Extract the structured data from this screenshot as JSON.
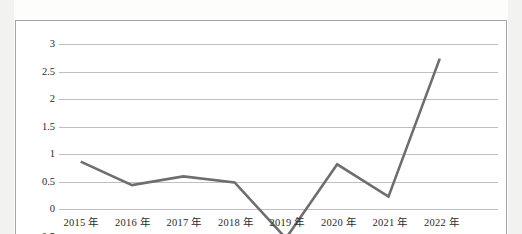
{
  "chart_data": {
    "type": "line",
    "title": "",
    "subtitle": "",
    "xlabel": "",
    "ylabel": "",
    "categories": [
      "2015 年",
      "2016 年",
      "2017 年",
      "2018 年",
      "2019 年",
      "2020 年",
      "2021 年",
      "2022 年"
    ],
    "values": [
      0.85,
      0.42,
      0.58,
      0.47,
      -0.55,
      0.8,
      0.21,
      2.73
    ],
    "series": [
      {
        "name": "",
        "values": [
          0.85,
          0.42,
          0.58,
          0.47,
          -0.55,
          0.8,
          0.21,
          2.73
        ]
      }
    ],
    "ylim": [
      -0.5,
      3
    ],
    "y_ticks": [
      "3",
      "2.5",
      "2",
      "1.5",
      "1",
      "0.5",
      "0",
      "-0.5"
    ],
    "y_tick_values": [
      3,
      2.5,
      2,
      1.5,
      1,
      0.5,
      0,
      -0.5
    ],
    "x_ticks": [
      "2015 年",
      "2016 年",
      "2017 年",
      "2018 年",
      "2019 年",
      "2020 年",
      "2021 年",
      "2022 年"
    ],
    "grid": true,
    "legend": "none",
    "line_color": "#6e6e6e",
    "gridline_color": "#bfbfbf",
    "border_color": "#a6a6a6",
    "background_color": "#ffffff",
    "note": "bottom of chart is cropped; the -0.5 tick label and the 2019 trough are cut off by the image edge"
  }
}
